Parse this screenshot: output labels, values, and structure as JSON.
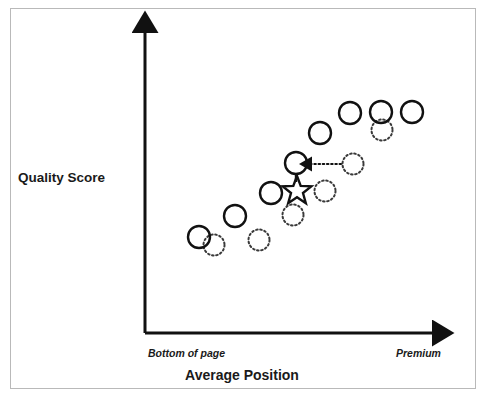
{
  "figure": {
    "background_color": "#ffffff",
    "frame_color": "#b9b9b9",
    "ink_color": "#111111"
  },
  "axes": {
    "y_title": "Quality Score",
    "x_title": "Average Position",
    "x_tick_left": "Bottom of page",
    "x_tick_right": "Premium",
    "origin": {
      "x": 145,
      "y": 333
    },
    "x_axis_end": {
      "x": 443,
      "y": 333
    },
    "y_axis_end": {
      "x": 145,
      "y": 22
    },
    "arrow_heads": [
      "x-axis-arrow",
      "y-axis-arrow"
    ]
  },
  "legend_note": {
    "solid_circle_meaning": "current position",
    "dotted_circle_meaning": "previous position",
    "star_meaning": "highlighted keyword",
    "dotted_arrow_meaning": "improvement movement"
  },
  "chart_data": {
    "type": "scatter",
    "title": "",
    "xlabel": "Average Position",
    "ylabel": "Quality Score",
    "xtick_labels": [
      "Bottom of page",
      "Premium"
    ],
    "grid": false,
    "legend": "none",
    "xlim": [
      0,
      1
    ],
    "ylim": [
      0,
      1
    ],
    "series": [
      {
        "name": "Current (solid circles)",
        "marker": "solid-circle",
        "stroke": "#111111",
        "fill": "none",
        "stroke_width": 2.4,
        "radius": 11,
        "points": [
          {
            "cx": 199,
            "cy": 237
          },
          {
            "cx": 235,
            "cy": 216
          },
          {
            "cx": 271,
            "cy": 193
          },
          {
            "cx": 296,
            "cy": 163
          },
          {
            "cx": 320,
            "cy": 133
          },
          {
            "cx": 350,
            "cy": 113
          },
          {
            "cx": 381,
            "cy": 112
          },
          {
            "cx": 412,
            "cy": 112
          }
        ]
      },
      {
        "name": "Previous (dotted circles)",
        "marker": "dotted-circle",
        "stroke": "#3a3a3a",
        "fill": "none",
        "stroke_width": 2.0,
        "dash": "1.6 2.6",
        "radius": 10.5,
        "points": [
          {
            "cx": 214,
            "cy": 245
          },
          {
            "cx": 259,
            "cy": 240
          },
          {
            "cx": 293,
            "cy": 215
          },
          {
            "cx": 325,
            "cy": 191
          },
          {
            "cx": 353,
            "cy": 164
          },
          {
            "cx": 382,
            "cy": 130
          }
        ]
      },
      {
        "name": "Highlighted keyword (star)",
        "marker": "star",
        "stroke": "#111111",
        "fill": "none",
        "stroke_width": 2.4,
        "radius": 15,
        "points": [
          {
            "cx": 297,
            "cy": 191
          }
        ]
      }
    ],
    "connectors": [
      {
        "name": "star-stem",
        "type": "solid-line",
        "from": {
          "x": 296,
          "y": 174
        },
        "to": {
          "x": 296,
          "y": 182
        }
      }
    ],
    "annotations": [
      {
        "name": "movement-arrow",
        "type": "dotted-arrow",
        "from": {
          "x": 341,
          "y": 164
        },
        "to": {
          "x": 310,
          "y": 164
        },
        "direction": "left",
        "meaning": "previous position moved to current position"
      }
    ]
  }
}
